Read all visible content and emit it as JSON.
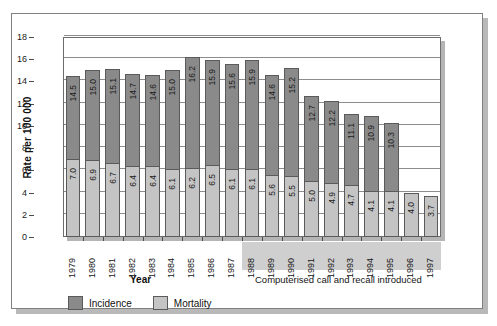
{
  "chart_data": {
    "type": "bar",
    "title": "",
    "subtitle": "",
    "xlabel": "Year",
    "ylabel": "Rate per 100 000",
    "ylim": [
      0,
      18
    ],
    "ytick_step": 2,
    "yticks": [
      "0",
      "2",
      "4",
      "6",
      "8",
      "10",
      "12",
      "14",
      "16",
      "18"
    ],
    "grid": true,
    "grid_orientation": "horizontal",
    "legend_position": "bottom-left",
    "bar_style": "overlaid",
    "categories": [
      "1979",
      "1980",
      "1981",
      "1982",
      "1983",
      "1984",
      "1985",
      "1986",
      "1987",
      "1988",
      "1989",
      "1990",
      "1991",
      "1992",
      "1993",
      "1994",
      "1995",
      "1996",
      "1997"
    ],
    "series": [
      {
        "name": "Incidence",
        "color": "#8a8a8a",
        "values": [
          14.5,
          15.0,
          15.1,
          14.7,
          14.6,
          15.0,
          16.2,
          15.9,
          15.6,
          15.9,
          14.6,
          15.2,
          12.7,
          12.2,
          11.1,
          10.9,
          10.3,
          null,
          null
        ],
        "labels": [
          "14.5",
          "15.0",
          "15.1",
          "14.7",
          "14.6",
          "15.0",
          "16.2",
          "15.9",
          "15.6",
          "15.9",
          "14.6",
          "15.2",
          "12.7",
          "12.2",
          "11.1",
          "10.9",
          "10.3",
          "",
          ""
        ]
      },
      {
        "name": "Mortality",
        "color": "#c4c4c4",
        "values": [
          7.0,
          6.9,
          6.7,
          6.4,
          6.4,
          6.1,
          6.2,
          6.5,
          6.1,
          6.1,
          5.6,
          5.5,
          5.0,
          4.9,
          4.7,
          4.1,
          4.1,
          4.0,
          3.7
        ],
        "labels": [
          "7.0",
          "6.9",
          "6.7",
          "6.4",
          "6.4",
          "6.1",
          "6.2",
          "6.5",
          "6.1",
          "6.1",
          "5.6",
          "5.5",
          "5.0",
          "4.9",
          "4.7",
          "4.1",
          "4.1",
          "4.0",
          "3.7"
        ]
      }
    ],
    "annotations": [
      {
        "text": "Computerised call and recall introduced",
        "start_category": "1988",
        "end_category": "1997"
      }
    ]
  },
  "legend": {
    "items": [
      {
        "label": "Incidence",
        "color": "#8a8a8a"
      },
      {
        "label": "Mortality",
        "color": "#c4c4c4"
      }
    ]
  },
  "axes": {
    "y_title": "Rate per 100 000",
    "x_title": "Year"
  }
}
